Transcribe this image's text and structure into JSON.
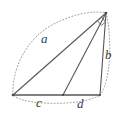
{
  "figure": {
    "stroke_color": "#555555",
    "dotted_color": "#9a9a9a",
    "background_color": "#ffffff",
    "labels": [
      {
        "name": "a",
        "text": "a",
        "role": "hypotenuse-side-label"
      },
      {
        "name": "b",
        "text": "b",
        "role": "right-side-label"
      },
      {
        "name": "c",
        "text": "c",
        "role": "base-left-segment-label"
      },
      {
        "name": "d",
        "text": "d",
        "role": "base-right-segment-label"
      }
    ],
    "vertices": {
      "apex": {
        "x": 106,
        "y": 13
      },
      "left": {
        "x": 13,
        "y": 95
      },
      "right": {
        "x": 100,
        "y": 95
      },
      "foot": {
        "x": 63,
        "y": 95
      }
    },
    "markers": [
      {
        "name": "right-angle-marker",
        "at": "apex"
      }
    ],
    "segments": [
      {
        "name": "side-a",
        "from": "left",
        "to": "apex",
        "style": "solid"
      },
      {
        "name": "side-b",
        "from": "right",
        "to": "apex",
        "style": "solid"
      },
      {
        "name": "base",
        "from": "left",
        "to": "right",
        "style": "solid"
      },
      {
        "name": "cevian",
        "from": "foot",
        "to": "apex",
        "style": "solid"
      }
    ],
    "curves": [
      {
        "name": "dotted-arc-upper-left",
        "style": "dotted"
      },
      {
        "name": "dotted-arc-right",
        "style": "dotted"
      },
      {
        "name": "dotted-arc-lower",
        "style": "dotted"
      }
    ]
  }
}
